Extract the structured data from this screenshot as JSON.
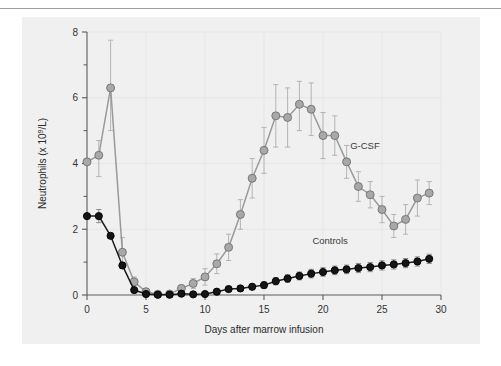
{
  "figure": {
    "background_color": "#f0f0f0",
    "rule_color": "#9aa0a6"
  },
  "chart_data": {
    "type": "line",
    "title": "",
    "xlabel": "Days after marrow infusion",
    "ylabel": "Neutrophils (x 10",
    "ylabel_sup": "9",
    "ylabel_tail": "/L)",
    "xlim": [
      0,
      30
    ],
    "ylim": [
      0,
      8
    ],
    "xticks": [
      0,
      5,
      10,
      15,
      20,
      25,
      30
    ],
    "xtick_labels": [
      "0",
      "5",
      "10",
      "15",
      "20",
      "25",
      "30"
    ],
    "yticks": [
      0,
      2,
      4,
      6,
      8
    ],
    "ytick_labels": [
      "0",
      "2",
      "4",
      "6",
      "8"
    ],
    "y_minor_ticks": [
      1,
      3,
      5,
      7
    ],
    "grid": true,
    "legend_position": "inline-annotation",
    "x": [
      0,
      1,
      2,
      3,
      4,
      5,
      6,
      7,
      8,
      9,
      10,
      11,
      12,
      13,
      14,
      15,
      16,
      17,
      18,
      19,
      20,
      21,
      22,
      23,
      24,
      25,
      26,
      27,
      28,
      29
    ],
    "series": [
      {
        "name": "G-CSF",
        "label": "G-CSF",
        "color": "#a8a8a8",
        "marker": "circle-filled-gray",
        "values": [
          4.05,
          4.25,
          6.3,
          1.3,
          0.4,
          0.1,
          0.02,
          0.03,
          0.2,
          0.35,
          0.55,
          0.95,
          1.45,
          2.45,
          3.55,
          4.4,
          5.45,
          5.4,
          5.8,
          5.65,
          4.85,
          4.85,
          4.05,
          3.3,
          3.05,
          2.6,
          2.1,
          2.3,
          2.95,
          3.1
        ],
        "err_upper": [
          0.0,
          0.45,
          1.45,
          0.45,
          0.15,
          0.1,
          0.05,
          0.05,
          0.1,
          0.15,
          0.25,
          0.3,
          0.4,
          0.45,
          0.6,
          0.7,
          0.95,
          0.9,
          0.7,
          0.8,
          0.7,
          0.6,
          0.5,
          0.45,
          0.4,
          0.4,
          0.35,
          0.45,
          0.55,
          0.35
        ],
        "err_lower": [
          0.0,
          0.65,
          1.3,
          0.5,
          0.2,
          0.1,
          0.02,
          0.03,
          0.1,
          0.15,
          0.25,
          0.3,
          0.4,
          0.45,
          0.6,
          0.7,
          0.95,
          0.9,
          0.8,
          0.8,
          0.7,
          0.6,
          0.5,
          0.45,
          0.4,
          0.4,
          0.35,
          0.45,
          0.55,
          0.35
        ]
      },
      {
        "name": "Controls",
        "label": "Controls",
        "color": "#151515",
        "marker": "circle-filled-black",
        "values": [
          2.4,
          2.4,
          1.8,
          0.9,
          0.15,
          0.03,
          0.01,
          0.01,
          0.04,
          0.02,
          0.03,
          0.1,
          0.18,
          0.2,
          0.25,
          0.3,
          0.42,
          0.5,
          0.58,
          0.65,
          0.7,
          0.75,
          0.78,
          0.82,
          0.85,
          0.9,
          0.93,
          0.97,
          1.02,
          1.1
        ],
        "err_upper": [
          0.0,
          0.2,
          0.0,
          0.0,
          0.0,
          0.0,
          0.0,
          0.0,
          0.06,
          0.06,
          0.06,
          0.07,
          0.08,
          0.08,
          0.09,
          0.1,
          0.11,
          0.12,
          0.12,
          0.13,
          0.13,
          0.13,
          0.13,
          0.14,
          0.14,
          0.14,
          0.14,
          0.14,
          0.14,
          0.14
        ],
        "err_lower": [
          0.0,
          0.2,
          0.0,
          0.0,
          0.0,
          0.0,
          0.0,
          0.0,
          0.06,
          0.06,
          0.06,
          0.07,
          0.08,
          0.08,
          0.09,
          0.1,
          0.11,
          0.12,
          0.12,
          0.13,
          0.13,
          0.13,
          0.13,
          0.14,
          0.14,
          0.14,
          0.14,
          0.14,
          0.14,
          0.14
        ]
      }
    ],
    "annotations": [
      {
        "text": "G-CSF",
        "x": 22.3,
        "y": 4.45
      },
      {
        "text": "Controls",
        "x": 19.1,
        "y": 1.55
      }
    ]
  }
}
